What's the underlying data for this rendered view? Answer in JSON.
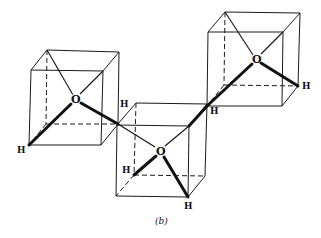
{
  "figure": {
    "caption": "(b)",
    "cubes": [
      {
        "name": "left",
        "oxygen_label": "O",
        "hydrogen_labels": [
          "H"
        ],
        "vertices": {
          "ftl": [
            31,
            70
          ],
          "ftr": [
            103,
            71
          ],
          "fbl": [
            29,
            145
          ],
          "fbr": [
            101,
            145
          ],
          "btl": [
            47,
            50
          ],
          "btr": [
            119,
            52
          ],
          "bbl": [
            46,
            124
          ],
          "bbr": [
            118,
            124
          ]
        },
        "oxygen": [
          75,
          99
        ]
      },
      {
        "name": "middle",
        "oxygen_label": "O",
        "hydrogen_labels": [
          "H",
          "H",
          "H",
          "H"
        ],
        "vertices": {
          "ftl": [
            117,
            125
          ],
          "ftr": [
            189,
            126
          ],
          "fbl": [
            116,
            196
          ],
          "fbr": [
            188,
            197
          ],
          "btl": [
            136,
            103
          ],
          "btr": [
            207,
            104
          ],
          "bbl": [
            134,
            175
          ],
          "bbr": [
            205,
            176
          ]
        },
        "oxygen": [
          160,
          151
        ]
      },
      {
        "name": "right",
        "oxygen_label": "O",
        "hydrogen_labels": [
          "H",
          "H"
        ],
        "vertices": {
          "ftl": [
            208,
            32
          ],
          "ftr": [
            283,
            32
          ],
          "fbl": [
            207,
            106
          ],
          "fbr": [
            282,
            106
          ],
          "btl": [
            225,
            12
          ],
          "btr": [
            300,
            13
          ],
          "bbl": [
            224,
            85
          ],
          "bbr": [
            298,
            86
          ]
        },
        "oxygen": [
          256,
          59
        ]
      }
    ],
    "labels": {
      "o_left": "O",
      "o_middle": "O",
      "o_right": "O",
      "h_left_bottom": "H",
      "h_left_link": "H",
      "h_middle_link_right": "H",
      "h_right": "H",
      "h_middle_inner": "H",
      "h_middle_bottom": "H"
    }
  }
}
